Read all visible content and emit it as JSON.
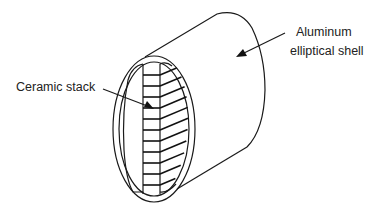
{
  "figure": {
    "type": "technical illustration",
    "labels": {
      "ceramic_stack": "Ceramic stack",
      "shell_line1": "Aluminum",
      "shell_line2": "elliptical shell"
    },
    "stack": {
      "layer_count": 11
    }
  }
}
